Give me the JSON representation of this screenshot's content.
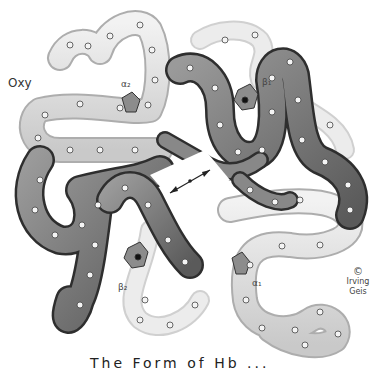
{
  "figure": {
    "title": "Oxy",
    "subunit_labels": {
      "alpha2": "α₂",
      "beta1": "β₁",
      "beta2": "β₂",
      "alpha1": "α₁"
    },
    "copyright": {
      "symbol": "©",
      "signature": "Irving Geis"
    },
    "caption_partial": "The  Form  of  Hb ...",
    "colors": {
      "background": "#ffffff",
      "alpha_chain_fill": "#d9d9d9",
      "beta_chain_fill": "#7a7a7a",
      "outline": "#333333",
      "node": "#f4f4f4"
    }
  }
}
